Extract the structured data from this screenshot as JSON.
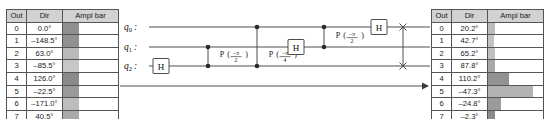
{
  "tables": {
    "headers": [
      "Out",
      "Dir",
      "Ampl bar"
    ],
    "left": {
      "caption": "input-state-amplitudes",
      "rows": [
        {
          "out": "0",
          "dir": "0.0°",
          "bar_pct": 29,
          "bar_color": "#8f8f8f"
        },
        {
          "out": "1",
          "dir": "–148.5°",
          "bar_pct": 29,
          "bar_color": "#919191"
        },
        {
          "out": "2",
          "dir": "63.0°",
          "bar_pct": 29,
          "bar_color": "#b9b9b9"
        },
        {
          "out": "3",
          "dir": "–85.5°",
          "bar_pct": 29,
          "bar_color": "#c7c7c7"
        },
        {
          "out": "4",
          "dir": "126.0°",
          "bar_pct": 29,
          "bar_color": "#8a8a8a"
        },
        {
          "out": "5",
          "dir": "–22.5°",
          "bar_pct": 29,
          "bar_color": "#9a9a9a"
        },
        {
          "out": "6",
          "dir": "–171.0°",
          "bar_pct": 29,
          "bar_color": "#bdbdbd"
        },
        {
          "out": "7",
          "dir": "40.5°",
          "bar_pct": 29,
          "bar_color": "#aaaaaa"
        }
      ]
    },
    "right": {
      "caption": "output-state-amplitudes",
      "rows": [
        {
          "out": "0",
          "dir": "20.2°",
          "bar_pct": 13,
          "bar_color": "#bcbcbc"
        },
        {
          "out": "1",
          "dir": "42.7°",
          "bar_pct": 11,
          "bar_color": "#c2c2c2"
        },
        {
          "out": "2",
          "dir": "65.2°",
          "bar_pct": 12,
          "bar_color": "#c0c0c0"
        },
        {
          "out": "3",
          "dir": "87.8°",
          "bar_pct": 13,
          "bar_color": "#a8a8a8"
        },
        {
          "out": "4",
          "dir": "110.2°",
          "bar_pct": 38,
          "bar_color": "#929292"
        },
        {
          "out": "5",
          "dir": "–47.3°",
          "bar_pct": 82,
          "bar_color": "#b3b3b3"
        },
        {
          "out": "6",
          "dir": "–24.8°",
          "bar_pct": 24,
          "bar_color": "#9b9b9b"
        },
        {
          "out": "7",
          "dir": "–2.3°",
          "bar_pct": 13,
          "bar_color": "#8b8b8b"
        }
      ]
    }
  },
  "circuit": {
    "name": "quantum-fourier-transform-circuit",
    "qubits": [
      {
        "base": "q",
        "sub": "0",
        "sep": ":"
      },
      {
        "base": "q",
        "sub": "1",
        "sep": ":"
      },
      {
        "base": "q",
        "sub": "2",
        "sep": ":"
      }
    ],
    "gates": {
      "h_label": "H",
      "p_label": "P",
      "paren_open": "(",
      "paren_close": ")",
      "phase_numerator": "−π",
      "phase_den_half": "2",
      "phase_den_quarter": "4",
      "swap_marker": "×"
    },
    "direction_arrow": "→"
  },
  "colors": {
    "wire": "#3a3a3a",
    "gate_fill": "#ffffff",
    "grid_border": "#555555",
    "header_fill": "#d2d2d2",
    "text": "#111111"
  }
}
